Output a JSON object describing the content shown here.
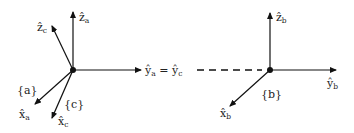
{
  "diagram": {
    "type": "coordinate-frames",
    "frames": [
      {
        "id": "a",
        "label": "{a}",
        "axes": {
          "x": "x̂",
          "x_sub": "a",
          "y": "ŷ",
          "y_sub": "a",
          "z": "ẑ",
          "z_sub": "a"
        }
      },
      {
        "id": "c",
        "label": "{c}",
        "axes": {
          "x": "x̂",
          "x_sub": "c",
          "y": "ŷ",
          "y_sub": "c",
          "z": "ẑ",
          "z_sub": "c"
        }
      },
      {
        "id": "b",
        "label": "{b}",
        "axes": {
          "x": "x̂",
          "x_sub": "b",
          "y": "ŷ",
          "y_sub": "b",
          "z": "ẑ",
          "z_sub": "b"
        }
      }
    ],
    "shared_axis": {
      "left": "ŷ",
      "left_sub": "a",
      "eq": " = ",
      "right": "ŷ",
      "right_sub": "c"
    },
    "connector": "dashed line from ŷc to origin of {b}",
    "color": "#111111"
  }
}
